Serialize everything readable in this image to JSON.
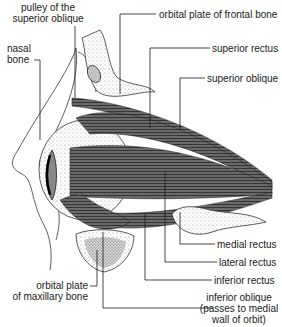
{
  "diagram": {
    "labels": {
      "pulley": [
        "pulley of the",
        "superior oblique"
      ],
      "nasal_bone": [
        "nasal",
        "bone"
      ],
      "frontal_plate": "orbital plate of frontal bone",
      "superior_rectus": "superior rectus",
      "superior_oblique": "superior oblique",
      "medial_rectus": "medial rectus",
      "lateral_rectus": "lateral rectus",
      "inferior_rectus": "inferior rectus",
      "inferior_oblique": [
        "inferior oblique",
        "(passes to medial",
        "wall of orbit)"
      ],
      "maxillary_plate": [
        "orbital plate",
        "of maxillary bone"
      ]
    },
    "colors": {
      "ink": "#1a1a1a",
      "muscle": "#555555",
      "muscle_dark": "#3a3a3a",
      "background": "#ffffff"
    }
  }
}
